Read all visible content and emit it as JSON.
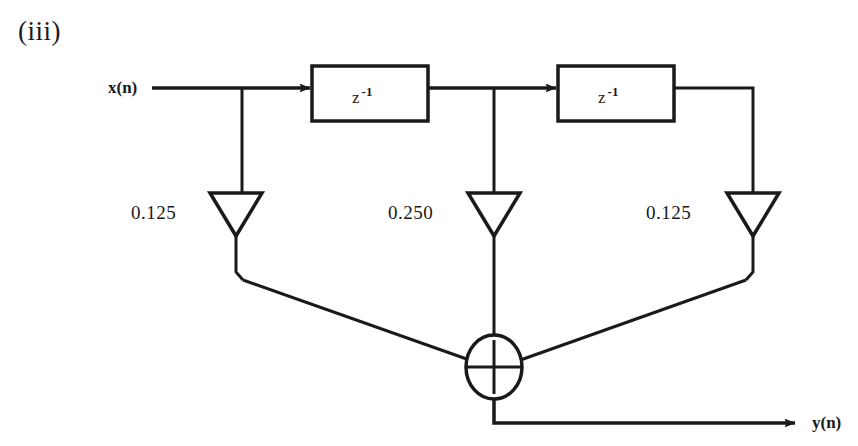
{
  "figure": {
    "part_label": "(iii)",
    "type": "direct-form FIR filter signal flow graph",
    "input_label": "x(n)",
    "output_label": "y(n)",
    "line_color": "#1a1a1a",
    "background_color": "#ffffff"
  },
  "delays": [
    {
      "id": "delay-1",
      "label_base": "z",
      "label_exponent": "-1"
    },
    {
      "id": "delay-2",
      "label_base": "z",
      "label_exponent": "-1"
    }
  ],
  "coefficients": [
    {
      "id": "coef-1",
      "value": "0.125",
      "tap": "x(n)"
    },
    {
      "id": "coef-2",
      "value": "0.250",
      "tap": "x(n-1)"
    },
    {
      "id": "coef-3",
      "value": "0.125",
      "tap": "x(n-2)"
    }
  ],
  "adder": {
    "id": "summing-junction",
    "symbol": "+",
    "inputs": 3
  }
}
